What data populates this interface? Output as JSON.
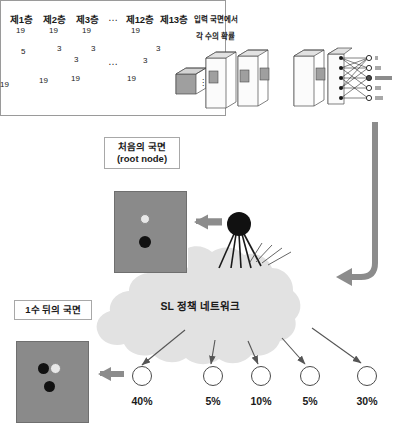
{
  "nn_panel": {
    "layer_labels": [
      "제1층",
      "제2층",
      "제3층",
      "제12층",
      "제13층"
    ],
    "layer_ellipsis": "…",
    "dim_labels": [
      "19",
      "19",
      "19",
      "19"
    ],
    "side_dims": [
      "19",
      "19",
      "19",
      "19"
    ],
    "kernel_labels": [
      "5",
      "3",
      "3",
      "3",
      "3",
      "3"
    ],
    "input_caption": "입력 국면에서",
    "output_caption": "각 수의 확률",
    "output_ellipsis": "⋮",
    "middle_ellipsis": "…"
  },
  "root_callout": {
    "line1": "처음의 국면",
    "line2": "(root node)"
  },
  "child_callout": {
    "line1": "1수 뒤의 국면"
  },
  "cloud": {
    "label": "SL 정책 네트워크"
  },
  "leaves": [
    {
      "pct": "40%"
    },
    {
      "pct": "5%"
    },
    {
      "pct": "10%"
    },
    {
      "pct": "5%"
    },
    {
      "pct": "30%"
    }
  ],
  "boards": {
    "root_board": {
      "stones": [
        {
          "color": "white"
        },
        {
          "color": "black"
        }
      ]
    },
    "child_board": {
      "stones": [
        {
          "color": "black"
        },
        {
          "color": "white"
        },
        {
          "color": "black"
        }
      ]
    }
  },
  "colors": {
    "board_bg": "#8a8a8a",
    "grid_line": "#6a6a6a",
    "arrow_gray": "#8c8c8c",
    "cloud_fill": "#e2e2e2",
    "stone_black": "#111111",
    "stone_white": "#e8e8e8",
    "panel_border": "#9a9a9a",
    "text": "#1a1a1a"
  }
}
